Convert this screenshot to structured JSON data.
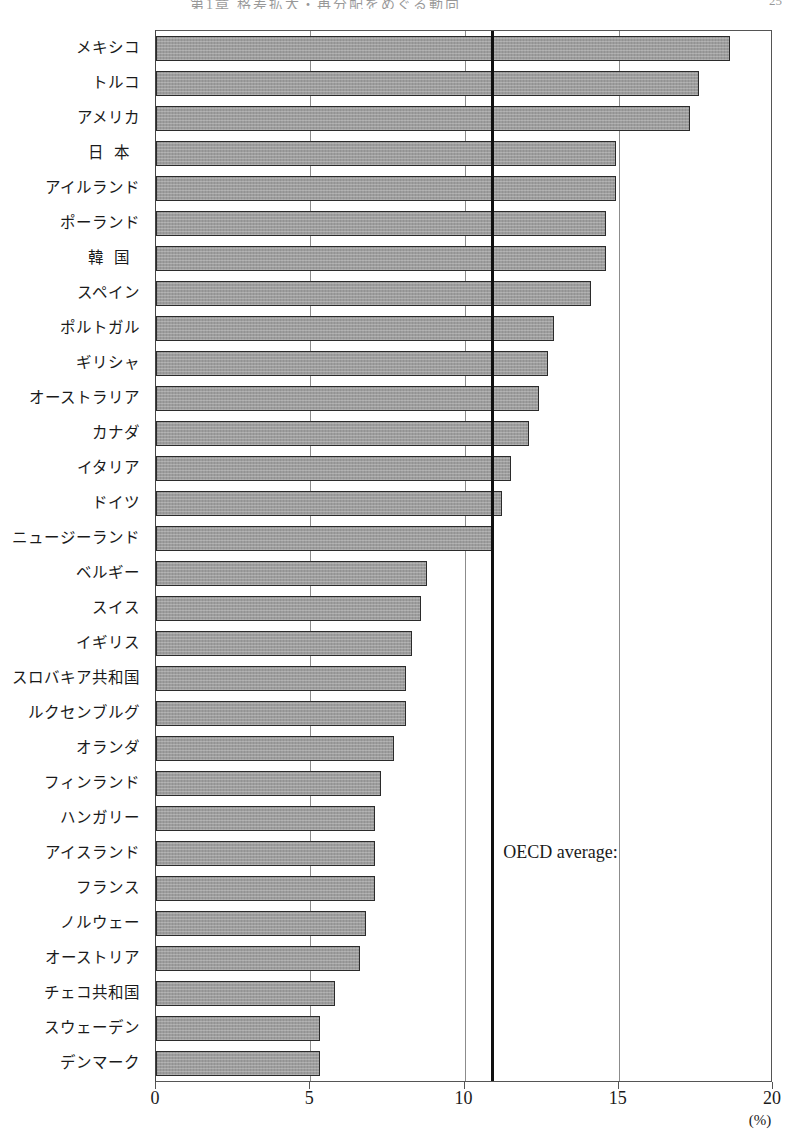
{
  "page_header": {
    "title": "第1章 格差拡大・再分配をめぐる動向",
    "page_number": "25"
  },
  "annotations": {
    "oecd_average_label": "OECD average:"
  },
  "axis": {
    "x_ticks": [
      "0",
      "5",
      "10",
      "15",
      "20"
    ],
    "x_unit": "(%)"
  },
  "chart_data": {
    "type": "bar",
    "orientation": "horizontal",
    "title": "",
    "xlabel": "(%)",
    "ylabel": "",
    "xlim": [
      0,
      20
    ],
    "x_ticks": [
      0,
      5,
      10,
      15,
      20
    ],
    "grid": true,
    "grid_axis": "x",
    "legend": false,
    "bar_color": "#9d9d9d",
    "bar_edge_color": "#2b2b2b",
    "annotation_line": {
      "label": "OECD average:",
      "value": 10.9,
      "color": "#101010",
      "orientation": "vertical"
    },
    "categories": [
      "メキシコ",
      "トルコ",
      "アメリカ",
      "日 本",
      "アイルランド",
      "ポーランド",
      "韓 国",
      "スペイン",
      "ポルトガル",
      "ギリシャ",
      "オーストラリア",
      "カナダ",
      "イタリア",
      "ドイツ",
      "ニュージーランド",
      "ベルギー",
      "スイス",
      "イギリス",
      "スロバキア共和国",
      "ルクセンブルグ",
      "オランダ",
      "フィンランド",
      "ハンガリー",
      "アイスランド",
      "フランス",
      "ノルウェー",
      "オーストリア",
      "チェコ共和国",
      "スウェーデン",
      "デンマーク"
    ],
    "values": [
      18.6,
      17.6,
      17.3,
      14.9,
      14.9,
      14.6,
      14.6,
      14.1,
      12.9,
      12.7,
      12.4,
      12.1,
      11.5,
      11.2,
      10.9,
      8.8,
      8.6,
      8.3,
      8.1,
      8.1,
      7.7,
      7.3,
      7.1,
      7.1,
      7.1,
      6.8,
      6.6,
      5.8,
      5.3,
      5.3
    ],
    "spaced_categories": [
      "日 本",
      "韓 国"
    ]
  }
}
